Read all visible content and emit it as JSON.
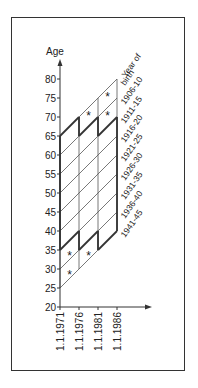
{
  "diagram": {
    "type": "lexis-diagram",
    "y_axis": {
      "label": "Age",
      "ticks": [
        20,
        25,
        30,
        35,
        40,
        45,
        50,
        55,
        60,
        65,
        70,
        75,
        80
      ]
    },
    "x_axis": {
      "ticks": [
        "1.1.1971",
        "1.1.1976",
        "1.1.1981",
        "1.1.1986"
      ],
      "years": [
        1971,
        1976,
        1981,
        1986
      ]
    },
    "cohort_header": [
      "Year of",
      "birth"
    ],
    "cohorts": [
      "1906-10",
      "1911-15",
      "1916-20",
      "1921-25",
      "1926-30",
      "1931-35",
      "1936-40",
      "1941-45"
    ],
    "cohort_boundaries": [
      1906,
      1911,
      1916,
      1921,
      1926,
      1931,
      1936,
      1941,
      1946
    ],
    "asterisks": [
      {
        "year": 1983.5,
        "age": 75.5
      },
      {
        "year": 1983.5,
        "age": 70.5
      },
      {
        "year": 1978.5,
        "age": 70.5
      },
      {
        "year": 1973.5,
        "age": 33.5
      },
      {
        "year": 1978.5,
        "age": 33.5
      },
      {
        "year": 1973.5,
        "age": 28.5
      }
    ],
    "marker_symbol": "*",
    "colors": {
      "line": "#333333",
      "thin_line": "#555555",
      "text": "#222222",
      "background": "#ffffff"
    }
  }
}
